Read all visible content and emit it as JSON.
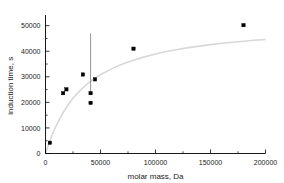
{
  "chart_data": {
    "type": "scatter",
    "title": "",
    "xlabel": "molar mass, Da",
    "ylabel": "induction time, s",
    "xlim": [
      0,
      200000
    ],
    "ylim": [
      0,
      53000
    ],
    "xticks": [
      0,
      50000,
      100000,
      150000,
      200000
    ],
    "yticks": [
      0,
      10000,
      20000,
      30000,
      40000,
      50000
    ],
    "xtick_labels": [
      "0",
      "50000",
      "100000",
      "150000",
      "200000"
    ],
    "ytick_labels": [
      "0",
      "10000",
      "20000",
      "30000",
      "40000",
      "50000"
    ],
    "grid": false,
    "legend": false,
    "minor_ticks": true,
    "marker_style": "filled-square",
    "marker_color": "#000000",
    "curve_color": "#d8d8d8",
    "errorbar_color": "#8a8a8a",
    "points": [
      {
        "x": 4000,
        "y": 4200
      },
      {
        "x": 16000,
        "y": 23600
      },
      {
        "x": 19000,
        "y": 25100
      },
      {
        "x": 34000,
        "y": 30900
      },
      {
        "x": 41000,
        "y": 19800
      },
      {
        "x": 41000,
        "y": 23600
      },
      {
        "x": 45000,
        "y": 29000
      },
      {
        "x": 80000,
        "y": 41000
      },
      {
        "x": 180000,
        "y": 50200
      }
    ],
    "errorbars": [
      {
        "x": 41000,
        "ylow": 23500,
        "yhigh": 47000
      }
    ],
    "fit_curve": {
      "description": "saturating hyperbolic fit",
      "points": [
        {
          "x": 0,
          "y": 0
        },
        {
          "x": 4000,
          "y": 5100
        },
        {
          "x": 8000,
          "y": 9300
        },
        {
          "x": 12000,
          "y": 12900
        },
        {
          "x": 16000,
          "y": 16000
        },
        {
          "x": 20000,
          "y": 18700
        },
        {
          "x": 25000,
          "y": 21600
        },
        {
          "x": 30000,
          "y": 24000
        },
        {
          "x": 35000,
          "y": 26100
        },
        {
          "x": 40000,
          "y": 27900
        },
        {
          "x": 45000,
          "y": 29400
        },
        {
          "x": 50000,
          "y": 30800
        },
        {
          "x": 60000,
          "y": 33100
        },
        {
          "x": 70000,
          "y": 35000
        },
        {
          "x": 80000,
          "y": 36500
        },
        {
          "x": 90000,
          "y": 37800
        },
        {
          "x": 100000,
          "y": 38900
        },
        {
          "x": 110000,
          "y": 39900
        },
        {
          "x": 120000,
          "y": 40700
        },
        {
          "x": 130000,
          "y": 41400
        },
        {
          "x": 140000,
          "y": 42000
        },
        {
          "x": 150000,
          "y": 42600
        },
        {
          "x": 160000,
          "y": 43100
        },
        {
          "x": 170000,
          "y": 43500
        },
        {
          "x": 180000,
          "y": 43900
        },
        {
          "x": 190000,
          "y": 44300
        },
        {
          "x": 200000,
          "y": 44600
        }
      ]
    }
  }
}
